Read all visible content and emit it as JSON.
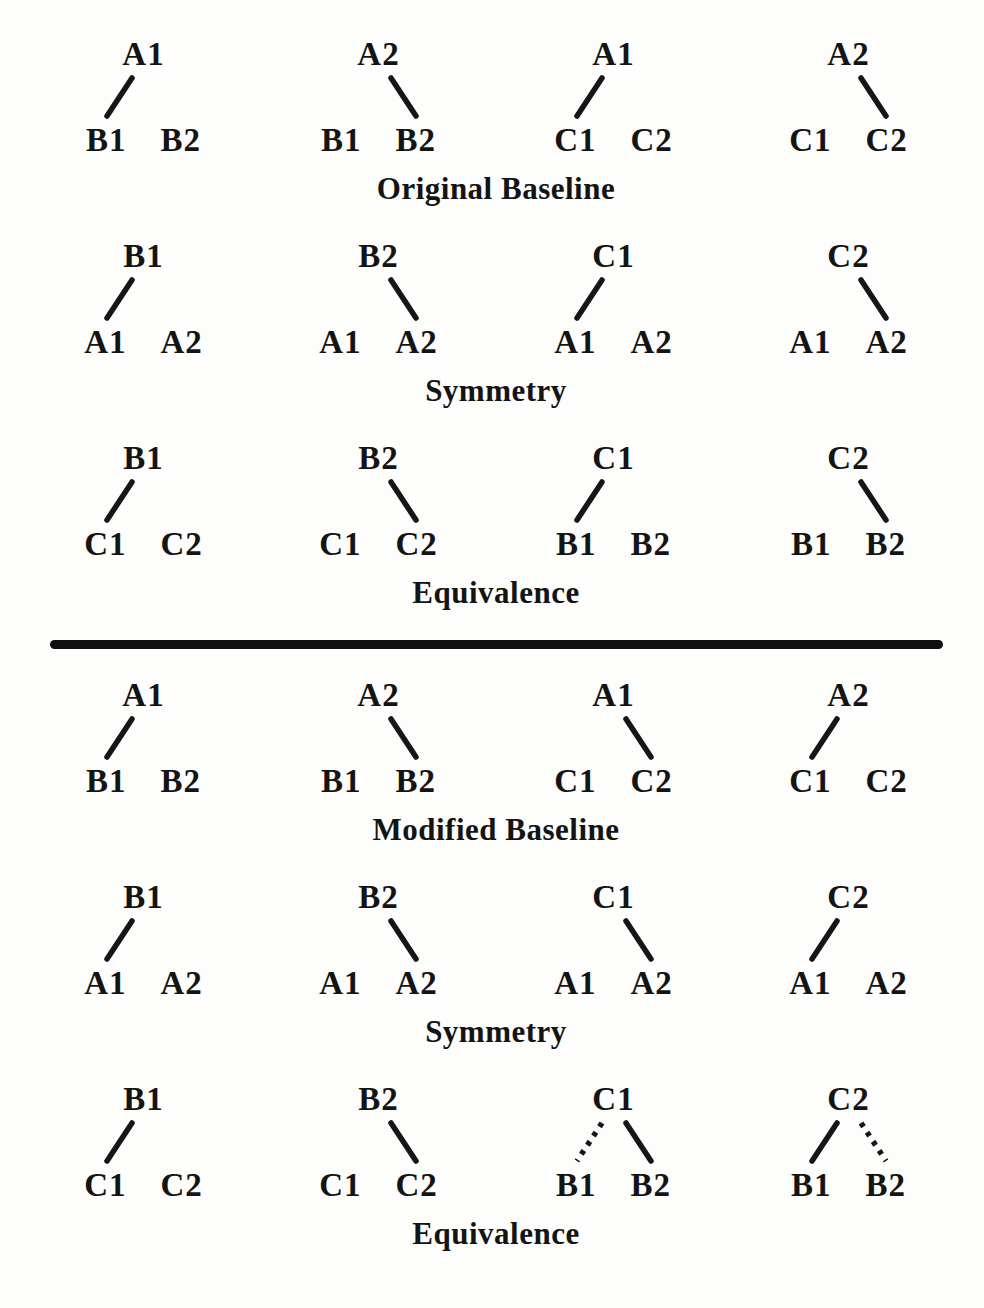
{
  "page": {
    "background": "#fdfdfb",
    "text_color": "#141414",
    "line_color": "#161616",
    "divider_color": "#101010"
  },
  "divider_after_section_index": 2,
  "sections": [
    {
      "label": "Original Baseline",
      "trees": [
        {
          "sample": "A1",
          "comparisons": [
            "B1",
            "B2"
          ],
          "links": [
            {
              "to": "left",
              "style": "solid"
            }
          ]
        },
        {
          "sample": "A2",
          "comparisons": [
            "B1",
            "B2"
          ],
          "links": [
            {
              "to": "right",
              "style": "solid"
            }
          ]
        },
        {
          "sample": "A1",
          "comparisons": [
            "C1",
            "C2"
          ],
          "links": [
            {
              "to": "left",
              "style": "solid"
            }
          ]
        },
        {
          "sample": "A2",
          "comparisons": [
            "C1",
            "C2"
          ],
          "links": [
            {
              "to": "right",
              "style": "solid"
            }
          ]
        }
      ]
    },
    {
      "label": "Symmetry",
      "trees": [
        {
          "sample": "B1",
          "comparisons": [
            "A1",
            "A2"
          ],
          "links": [
            {
              "to": "left",
              "style": "solid"
            }
          ]
        },
        {
          "sample": "B2",
          "comparisons": [
            "A1",
            "A2"
          ],
          "links": [
            {
              "to": "right",
              "style": "solid"
            }
          ]
        },
        {
          "sample": "C1",
          "comparisons": [
            "A1",
            "A2"
          ],
          "links": [
            {
              "to": "left",
              "style": "solid"
            }
          ]
        },
        {
          "sample": "C2",
          "comparisons": [
            "A1",
            "A2"
          ],
          "links": [
            {
              "to": "right",
              "style": "solid"
            }
          ]
        }
      ]
    },
    {
      "label": "Equivalence",
      "trees": [
        {
          "sample": "B1",
          "comparisons": [
            "C1",
            "C2"
          ],
          "links": [
            {
              "to": "left",
              "style": "solid"
            }
          ]
        },
        {
          "sample": "B2",
          "comparisons": [
            "C1",
            "C2"
          ],
          "links": [
            {
              "to": "right",
              "style": "solid"
            }
          ]
        },
        {
          "sample": "C1",
          "comparisons": [
            "B1",
            "B2"
          ],
          "links": [
            {
              "to": "left",
              "style": "solid"
            }
          ]
        },
        {
          "sample": "C2",
          "comparisons": [
            "B1",
            "B2"
          ],
          "links": [
            {
              "to": "right",
              "style": "solid"
            }
          ]
        }
      ]
    },
    {
      "label": "Modified Baseline",
      "trees": [
        {
          "sample": "A1",
          "comparisons": [
            "B1",
            "B2"
          ],
          "links": [
            {
              "to": "left",
              "style": "solid"
            }
          ]
        },
        {
          "sample": "A2",
          "comparisons": [
            "B1",
            "B2"
          ],
          "links": [
            {
              "to": "right",
              "style": "solid"
            }
          ]
        },
        {
          "sample": "A1",
          "comparisons": [
            "C1",
            "C2"
          ],
          "links": [
            {
              "to": "right",
              "style": "solid"
            }
          ]
        },
        {
          "sample": "A2",
          "comparisons": [
            "C1",
            "C2"
          ],
          "links": [
            {
              "to": "left",
              "style": "solid"
            }
          ]
        }
      ]
    },
    {
      "label": "Symmetry",
      "trees": [
        {
          "sample": "B1",
          "comparisons": [
            "A1",
            "A2"
          ],
          "links": [
            {
              "to": "left",
              "style": "solid"
            }
          ]
        },
        {
          "sample": "B2",
          "comparisons": [
            "A1",
            "A2"
          ],
          "links": [
            {
              "to": "right",
              "style": "solid"
            }
          ]
        },
        {
          "sample": "C1",
          "comparisons": [
            "A1",
            "A2"
          ],
          "links": [
            {
              "to": "right",
              "style": "solid"
            }
          ]
        },
        {
          "sample": "C2",
          "comparisons": [
            "A1",
            "A2"
          ],
          "links": [
            {
              "to": "left",
              "style": "solid"
            }
          ]
        }
      ]
    },
    {
      "label": "Equivalence",
      "trees": [
        {
          "sample": "B1",
          "comparisons": [
            "C1",
            "C2"
          ],
          "links": [
            {
              "to": "left",
              "style": "solid"
            }
          ]
        },
        {
          "sample": "B2",
          "comparisons": [
            "C1",
            "C2"
          ],
          "links": [
            {
              "to": "right",
              "style": "solid"
            }
          ]
        },
        {
          "sample": "C1",
          "comparisons": [
            "B1",
            "B2"
          ],
          "links": [
            {
              "to": "left",
              "style": "dotted"
            },
            {
              "to": "right",
              "style": "solid"
            }
          ]
        },
        {
          "sample": "C2",
          "comparisons": [
            "B1",
            "B2"
          ],
          "links": [
            {
              "to": "left",
              "style": "solid"
            },
            {
              "to": "right",
              "style": "dotted"
            }
          ]
        }
      ]
    }
  ]
}
